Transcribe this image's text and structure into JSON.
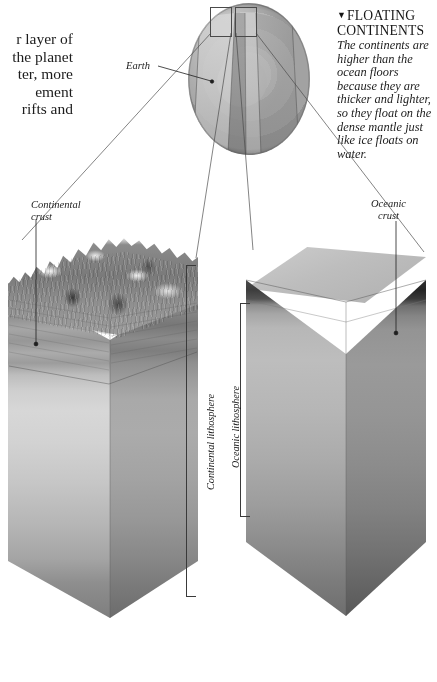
{
  "figure": {
    "title_hidden": "Earth crust cutaway diagram",
    "body_text_left": "r layer of\nthe planet\nter, more\nement\nrifts and"
  },
  "callout": {
    "marker": "▼",
    "heading_line1": "FLOATING",
    "heading_line2": "CONTINENTS",
    "body": "The continents are higher than the ocean floors because they are thicker and lighter, so they float on the dense mantle just like ice floats on water."
  },
  "labels": {
    "earth": "Earth",
    "continental_crust": "Continental\ncrust",
    "oceanic_crust": "Oceanic\ncrust",
    "continental_lithosphere": "Continental lithosphere",
    "oceanic_lithosphere": "Oceanic lithosphere"
  },
  "colors": {
    "page_background": "#ffffff",
    "ink": "#1a1a1a",
    "line": "#3a3a3a",
    "globe_core": "#e4e4e4",
    "globe_mantle": "#a2a2a2",
    "globe_rim": "#7e7e7e",
    "oceanic_crust_dark": "#2f2f2f",
    "mantle_light": "#bdbdbd",
    "mantle_deep": "#6e6e6e"
  },
  "diagram": {
    "type": "cutaway-cross-section",
    "globe": {
      "label": "Earth",
      "shells": [
        "inner core",
        "outer core",
        "mantle",
        "lithosphere / crust"
      ],
      "segment_boxes": 2,
      "segment_box_note": "two small rectangles marking the crust sections magnified below"
    },
    "blocks": [
      {
        "name": "continental-block",
        "label": "Continental crust",
        "bracket_label": "Continental lithosphere",
        "surface": "mountainous rocky land",
        "layers": [
          "continental crust (thick, layered)",
          "upper mantle"
        ]
      },
      {
        "name": "oceanic-block",
        "label": "Oceanic crust",
        "bracket_label": "Oceanic lithosphere",
        "surface": "flat ocean water",
        "layers": [
          "ocean water",
          "oceanic crust (thin, dark)",
          "upper mantle"
        ]
      }
    ],
    "leader_lines": 4
  }
}
